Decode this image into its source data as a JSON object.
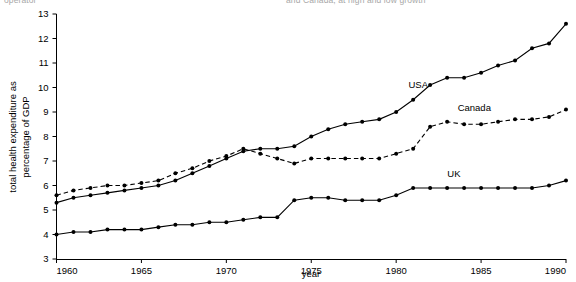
{
  "top_cropped_text": {
    "left_fragment": "operator",
    "right_fragment": "and Canada, at high and low growth"
  },
  "axis": {
    "y_title": "total health expenditure as percentage of GDP",
    "x_title": "year",
    "y_ticks": [
      3,
      4,
      5,
      6,
      7,
      8,
      9,
      10,
      11,
      12,
      13
    ],
    "x_ticks": [
      1960,
      1965,
      1970,
      1975,
      1980,
      1985,
      1990
    ]
  },
  "series_labels": {
    "usa": "USA",
    "canada": "Canada",
    "uk": "UK"
  },
  "colors": {
    "ink": "#000000",
    "background": "#ffffff"
  },
  "chart_data": {
    "type": "line",
    "title": "",
    "xlabel": "year",
    "ylabel": "total health expenditure as percentage of GDP",
    "xlim": [
      1960,
      1990
    ],
    "ylim": [
      3,
      13
    ],
    "grid": false,
    "legend": "inline-annotations",
    "x": [
      1960,
      1961,
      1962,
      1963,
      1964,
      1965,
      1966,
      1967,
      1968,
      1969,
      1970,
      1971,
      1972,
      1973,
      1974,
      1975,
      1976,
      1977,
      1978,
      1979,
      1980,
      1981,
      1982,
      1983,
      1984,
      1985,
      1986,
      1987,
      1988,
      1989,
      1990
    ],
    "series": [
      {
        "name": "USA",
        "style": "solid",
        "marker": "filled-circle",
        "values": [
          5.3,
          5.5,
          5.6,
          5.7,
          5.8,
          5.9,
          6.0,
          6.2,
          6.5,
          6.8,
          7.1,
          7.4,
          7.5,
          7.5,
          7.6,
          8.0,
          8.3,
          8.5,
          8.6,
          8.7,
          9.0,
          9.5,
          10.1,
          10.4,
          10.4,
          10.6,
          10.9,
          11.1,
          11.6,
          11.8,
          12.6
        ]
      },
      {
        "name": "Canada",
        "style": "dashed",
        "marker": "filled-circle",
        "values": [
          5.6,
          5.8,
          5.9,
          6.0,
          6.0,
          6.1,
          6.2,
          6.5,
          6.7,
          7.0,
          7.2,
          7.5,
          7.3,
          7.1,
          6.9,
          7.1,
          7.1,
          7.1,
          7.1,
          7.1,
          7.3,
          7.5,
          8.4,
          8.6,
          8.5,
          8.5,
          8.6,
          8.7,
          8.7,
          8.8,
          9.1
        ]
      },
      {
        "name": "UK",
        "style": "solid",
        "marker": "filled-circle",
        "values": [
          4.0,
          4.1,
          4.1,
          4.2,
          4.2,
          4.2,
          4.3,
          4.4,
          4.4,
          4.5,
          4.5,
          4.6,
          4.7,
          4.7,
          5.4,
          5.5,
          5.5,
          5.4,
          5.4,
          5.4,
          5.6,
          5.9,
          5.9,
          5.9,
          5.9,
          5.9,
          5.9,
          5.9,
          5.9,
          6.0,
          6.2
        ]
      }
    ],
    "annotations": [
      {
        "text": "USA",
        "x": 1981.3,
        "y": 10.0
      },
      {
        "text": "Canada",
        "x": 1984.6,
        "y": 9.05
      },
      {
        "text": "UK",
        "x": 1983.4,
        "y": 6.35
      }
    ]
  }
}
